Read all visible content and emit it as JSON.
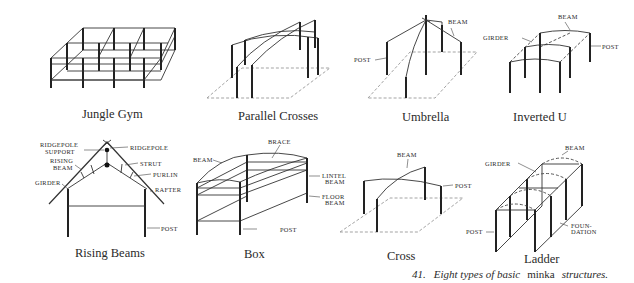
{
  "figure": {
    "caption": {
      "number": "41.",
      "prefix": "Eight types of basic",
      "term": "minka",
      "suffix": "structures."
    },
    "panels": [
      {
        "id": "jungle-gym",
        "title": "Jungle Gym",
        "labels": []
      },
      {
        "id": "parallel-crosses",
        "title": "Parallel Crosses",
        "labels": []
      },
      {
        "id": "umbrella",
        "title": "Umbrella",
        "labels": [
          "BEAM",
          "POST"
        ]
      },
      {
        "id": "inverted-u",
        "title": "Inverted U",
        "labels": [
          "BEAM",
          "GIRDER",
          "POST"
        ]
      },
      {
        "id": "rising-beams",
        "title": "Rising Beams",
        "labels": [
          "RIDGEPOLE",
          "SUPPORT",
          "RIDGEPOLE",
          "RISING",
          "BEAM",
          "STRUT",
          "PURLIN",
          "GIRDER",
          "RAFTER",
          "POST"
        ]
      },
      {
        "id": "box",
        "title": "Box",
        "labels": [
          "BRACE",
          "BEAM",
          "LINTEL",
          "BEAM",
          "FLOOR",
          "BEAM",
          "POST"
        ]
      },
      {
        "id": "cross",
        "title": "Cross",
        "labels": [
          "BEAM",
          "POST"
        ]
      },
      {
        "id": "ladder",
        "title": "Ladder",
        "labels": [
          "BEAM",
          "GIRDER",
          "POST",
          "FOUN-",
          "DATION"
        ]
      }
    ]
  }
}
